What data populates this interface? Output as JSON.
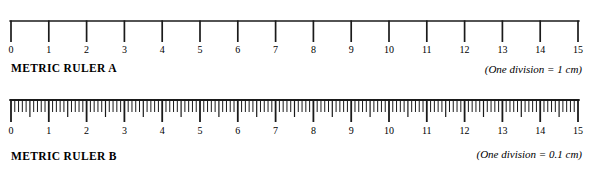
{
  "figure": {
    "background_color": "#ffffff",
    "ink_color": "#1a1a1a"
  },
  "rulers": [
    {
      "id": "metric-ruler-a",
      "title": "METRIC RULER A",
      "note": "(One division = 1 cm)",
      "unit_label": "cm",
      "min": 0,
      "max": 15,
      "major_step": 1,
      "minor_divisions_per_major": 1,
      "tick_labels": [
        "0",
        "1",
        "2",
        "3",
        "4",
        "5",
        "6",
        "7",
        "8",
        "9",
        "10",
        "11",
        "12",
        "13",
        "14",
        "15"
      ],
      "style": "open-bracket",
      "baseline_y": 21,
      "major_tick_length": 21,
      "left_x": 11,
      "right_x": 578
    },
    {
      "id": "metric-ruler-b",
      "title": "METRIC RULER B",
      "note": "(One division = 0.1 cm)",
      "unit_label": "cm",
      "min": 0,
      "max": 15,
      "major_step": 1,
      "minor_divisions_per_major": 10,
      "tick_labels": [
        "0",
        "1",
        "2",
        "3",
        "4",
        "5",
        "6",
        "7",
        "8",
        "9",
        "10",
        "11",
        "12",
        "13",
        "14",
        "15"
      ],
      "style": "filled-bar",
      "baseline_y": 14,
      "major_tick_length": 22,
      "half_tick_length": 17,
      "minor_tick_length": 12,
      "left_x": 11,
      "right_x": 578
    }
  ]
}
